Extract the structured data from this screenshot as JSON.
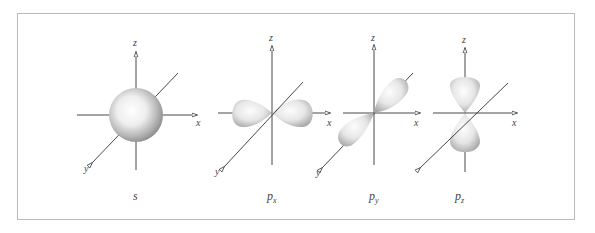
{
  "figure": {
    "axis_labels": {
      "x": "x",
      "y": "y",
      "z": "z"
    },
    "colors": {
      "axis": "#333333",
      "frame": "#b9b9b9",
      "orbital_light": "#fafafa",
      "orbital_dark": "#8a8a8a"
    }
  },
  "orbitals": [
    {
      "id": "s",
      "label_main": "s",
      "label_sub": "",
      "shape": "sphere"
    },
    {
      "id": "px",
      "label_main": "p",
      "label_sub": "x",
      "shape": "dumbbell-x"
    },
    {
      "id": "py",
      "label_main": "p",
      "label_sub": "y",
      "shape": "dumbbell-y"
    },
    {
      "id": "pz",
      "label_main": "p",
      "label_sub": "z",
      "shape": "dumbbell-z"
    }
  ]
}
